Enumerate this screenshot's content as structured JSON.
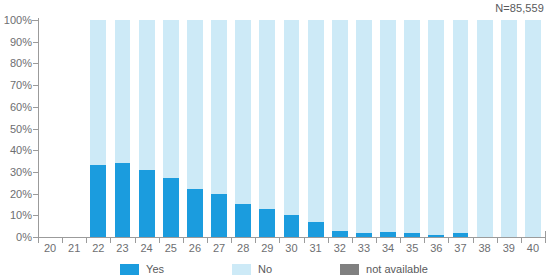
{
  "sample_note": "N=85,559",
  "legend": {
    "position": "bottom-center",
    "items": [
      {
        "label": "Yes",
        "color": "#1b9cde",
        "key": "yes"
      },
      {
        "label": "No",
        "color": "#cdeaf7",
        "key": "no"
      },
      {
        "label": "not available",
        "color": "#808080",
        "key": "na"
      }
    ]
  },
  "axes": {
    "y_ticks": [
      "0%",
      "10%",
      "20%",
      "30%",
      "40%",
      "50%",
      "60%",
      "70%",
      "80%",
      "90%",
      "100%"
    ],
    "y_values": [
      0,
      10,
      20,
      30,
      40,
      50,
      60,
      70,
      80,
      90,
      100
    ]
  },
  "chart_data": {
    "type": "bar",
    "stacked": true,
    "title": "",
    "subtitle": "",
    "xlabel": "",
    "ylabel": "",
    "ylim": [
      0,
      100
    ],
    "y_unit": "%",
    "grid": false,
    "legend_position": "bottom-center",
    "annotations": [
      "N=85,559"
    ],
    "categories": [
      "20",
      "21",
      "22",
      "23",
      "24",
      "25",
      "26",
      "27",
      "28",
      "29",
      "30",
      "31",
      "32",
      "33",
      "34",
      "35",
      "36",
      "37",
      "38",
      "39",
      "40"
    ],
    "series": [
      {
        "name": "Yes",
        "color": "#1b9cde",
        "values": [
          0,
          0,
          33,
          34,
          31,
          27,
          22,
          20,
          15,
          13,
          10,
          7,
          3,
          2,
          2.5,
          2,
          1,
          2,
          0,
          0,
          0
        ]
      },
      {
        "name": "No",
        "color": "#cdeaf7",
        "values": [
          0,
          0,
          67,
          66,
          69,
          73,
          78,
          80,
          85,
          87,
          90,
          93,
          97,
          98,
          97.5,
          98,
          99,
          98,
          100,
          100,
          100
        ]
      },
      {
        "name": "not available",
        "color": "#808080",
        "values": [
          0,
          0,
          0,
          0,
          0,
          0,
          0,
          0,
          0,
          0,
          0,
          0,
          0,
          0,
          0,
          0,
          0,
          0,
          0,
          0,
          0
        ]
      }
    ],
    "has_data": [
      false,
      false,
      true,
      true,
      true,
      true,
      true,
      true,
      true,
      true,
      true,
      true,
      true,
      true,
      true,
      true,
      true,
      true,
      true,
      true,
      true
    ]
  }
}
